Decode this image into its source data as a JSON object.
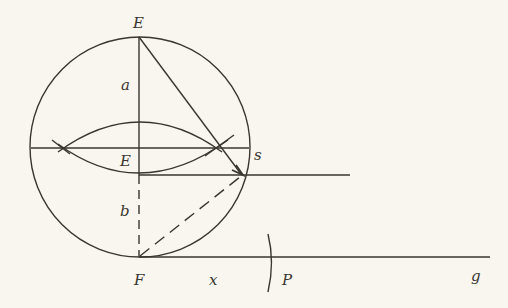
{
  "diagram": {
    "type": "geometric-construction",
    "colors": {
      "background": "#f8f6ef",
      "ink": "#3a3530"
    },
    "labels": {
      "E_top": "E",
      "a": "a",
      "E_mid": "E",
      "s": "s",
      "b": "b",
      "F": "F",
      "x": "x",
      "P": "P",
      "g": "g"
    },
    "elements": [
      {
        "id": "circle",
        "kind": "circle",
        "center": [
          140,
          147
        ],
        "radius": 110
      },
      {
        "id": "vertical-a",
        "kind": "segment",
        "from": "E_top",
        "to": "E_mid",
        "style": "solid",
        "label": "a"
      },
      {
        "id": "vertical-b",
        "kind": "segment",
        "from": "E_mid",
        "to": "F",
        "style": "dashed",
        "label": "b"
      },
      {
        "id": "chord",
        "kind": "segment",
        "style": "solid"
      },
      {
        "id": "lens",
        "kind": "two-arcs",
        "intersections": "chord-marks"
      },
      {
        "id": "diagonal",
        "kind": "segment",
        "from": "E_top",
        "to": "arrow-point",
        "style": "solid"
      },
      {
        "id": "ray-s",
        "kind": "ray",
        "from": "E_mid",
        "label": "s"
      },
      {
        "id": "dashed-diagonal",
        "kind": "segment",
        "from": "F",
        "to": "arrow-point",
        "style": "dashed"
      },
      {
        "id": "ray-g",
        "kind": "ray",
        "from": "F",
        "label": "g"
      },
      {
        "id": "arc-P",
        "kind": "arc-mark",
        "on": "ray-g",
        "label": "P",
        "segment_label": "x"
      }
    ]
  }
}
